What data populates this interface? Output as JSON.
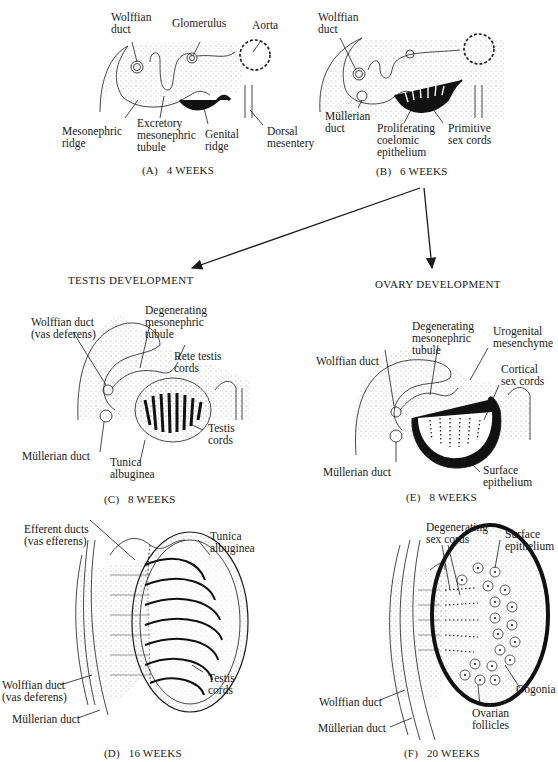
{
  "panels": {
    "A": {
      "caption": "(A)   4 WEEKS",
      "labels": {
        "wolffian_duct": "Wolffian\nduct",
        "glomerulus": "Glomerulus",
        "aorta": "Aorta",
        "mesonephric_ridge": "Mesonephric\nridge",
        "excretory_tubule": "Excretory\nmesonephric\ntubule",
        "genital_ridge": "Genital\nridge",
        "dorsal_mesentery": "Dorsal\nmesentery"
      }
    },
    "B": {
      "caption": "(B)   6 WEEKS",
      "labels": {
        "wolffian_duct": "Wolffian\nduct",
        "mullerian_duct": "Müllerian\nduct",
        "proliferating_epithelium": "Proliferating\ncoelomic\nepithelium",
        "primitive_sex_cords": "Primitive\nsex cords"
      }
    },
    "headers": {
      "testis": "TESTIS DEVELOPMENT",
      "ovary": "OVARY DEVELOPMENT"
    },
    "C": {
      "caption": "(C)   8 WEEKS",
      "labels": {
        "wolffian_duct": "Wolffian duct\n(vas deferens)",
        "degenerating_tubule": "Degenerating\nmesonephric\ntubule",
        "rete_testis": "Rete testis\ncords",
        "testis_cords": "Testis\ncords",
        "mullerian_duct": "Müllerian duct",
        "tunica_albuginea": "Tunica\nalbuginea"
      }
    },
    "E": {
      "caption": "(E)   8 WEEKS",
      "labels": {
        "degenerating_tubule": "Degenerating\nmesonephric\ntubule",
        "urogenital_mesenchyme": "Urogenital\nmesenchyme",
        "wolffian_duct": "Wolffian duct",
        "cortical_sex_cords": "Cortical\nsex cords",
        "mullerian_duct": "Müllerian duct",
        "surface_epithelium": "Surface\nepithelium"
      }
    },
    "D": {
      "caption": "(D)   16 WEEKS",
      "labels": {
        "efferent_ducts": "Efferent ducts\n(vas efferens)",
        "tunica_albuginea": "Tunica\nalbuginea",
        "wolffian_duct": "Wolffian duct\n(vas deferens)",
        "mullerian_duct": "Müllerian duct",
        "testis_cords": "Testis\ncords"
      }
    },
    "F": {
      "caption": "(F)   20 WEEKS",
      "labels": {
        "degenerating_sex_cords": "Degenerating\nsex cords",
        "surface_epithelium": "Surface\nepithelium",
        "wolffian_duct": "Wolffian duct",
        "mullerian_duct": "Müllerian duct",
        "oogonia": "Oogonia",
        "ovarian_follicles": "Ovarian\nfollicles"
      }
    }
  },
  "colors": {
    "ink": "#1a1a1a",
    "stipple": "#cfcfcf",
    "background": "#ffffff"
  }
}
